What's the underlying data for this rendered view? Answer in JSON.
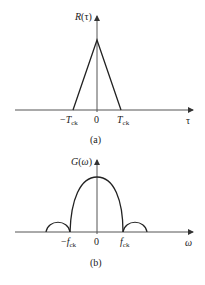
{
  "figure_a": {
    "y_label": "R(τ)",
    "x_label": "τ",
    "ticks": {
      "neg": "−T",
      "neg_sub": "ck",
      "zero": "0",
      "pos": "T",
      "pos_sub": "ck"
    },
    "caption": "(a)",
    "shape": "triangle"
  },
  "figure_b": {
    "y_label": "G(ω)",
    "x_label": "ω",
    "ticks": {
      "neg": "−f",
      "neg_sub": "ck",
      "zero": "0",
      "pos": "f",
      "pos_sub": "ck"
    },
    "caption": "(b)",
    "shape": "sinc-squared main lobe with side lobes"
  },
  "colors": {
    "line": "#222222",
    "axis": "#555555",
    "background": "#ffffff"
  }
}
